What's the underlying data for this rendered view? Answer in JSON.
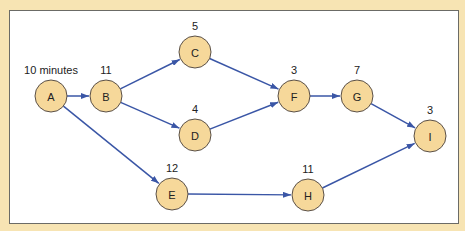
{
  "colors": {
    "background": "#f7e4b3",
    "panel": "#ffffff",
    "node_fill": "#f6d89a",
    "node_stroke": "#5a5048",
    "edge": "#3a56a6"
  },
  "nodes": [
    {
      "id": "A",
      "label": "A",
      "duration": "10 minutes",
      "x": 51,
      "y": 96
    },
    {
      "id": "B",
      "label": "B",
      "duration": "11",
      "x": 106,
      "y": 96
    },
    {
      "id": "C",
      "label": "C",
      "duration": "5",
      "x": 195,
      "y": 52
    },
    {
      "id": "D",
      "label": "D",
      "duration": "4",
      "x": 195,
      "y": 135
    },
    {
      "id": "E",
      "label": "E",
      "duration": "12",
      "x": 172,
      "y": 194
    },
    {
      "id": "F",
      "label": "F",
      "duration": "3",
      "x": 294,
      "y": 96
    },
    {
      "id": "G",
      "label": "G",
      "duration": "7",
      "x": 357,
      "y": 96
    },
    {
      "id": "H",
      "label": "H",
      "duration": "11",
      "x": 308,
      "y": 195
    },
    {
      "id": "I",
      "label": "I",
      "duration": "3",
      "x": 430,
      "y": 136
    }
  ],
  "edges": [
    {
      "from": "A",
      "to": "B"
    },
    {
      "from": "A",
      "to": "E"
    },
    {
      "from": "B",
      "to": "C"
    },
    {
      "from": "B",
      "to": "D"
    },
    {
      "from": "C",
      "to": "F"
    },
    {
      "from": "D",
      "to": "F"
    },
    {
      "from": "F",
      "to": "G"
    },
    {
      "from": "G",
      "to": "I"
    },
    {
      "from": "E",
      "to": "H"
    },
    {
      "from": "H",
      "to": "I"
    }
  ]
}
